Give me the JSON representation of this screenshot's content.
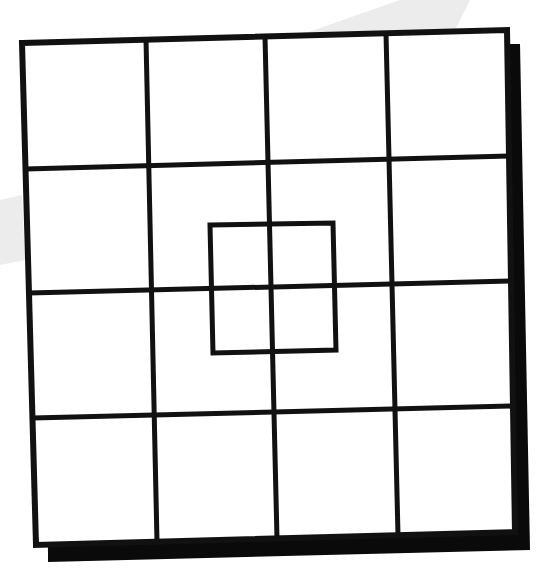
{
  "puzzle": {
    "kind": "square-grid-counting",
    "grid_rows": 4,
    "grid_cols": 4,
    "has_inner_square": true,
    "colors": {
      "background": "#ffffff",
      "line": "#111111",
      "shadow": "#0a0a0a",
      "watermark": "#ececec"
    },
    "outer": {
      "tl": [
        22,
        43
      ],
      "tr": [
        507,
        30
      ],
      "br": [
        515,
        532
      ],
      "bl": [
        36,
        545
      ]
    },
    "shadow": {
      "tl": [
        47,
        44
      ],
      "tr": [
        520,
        44
      ],
      "br": [
        530,
        550
      ],
      "bl": [
        48,
        562
      ]
    },
    "verticals_top_x": [
      146,
      265,
      386
    ],
    "verticals_bottom_x": [
      157,
      277,
      398
    ],
    "horizontals_left_y": [
      169,
      293,
      418
    ],
    "horizontals_right_y": [
      156,
      281,
      406
    ],
    "inner_square": {
      "tl": [
        210,
        225
      ],
      "tr": [
        333,
        223
      ],
      "br": [
        336,
        350
      ],
      "bl": [
        213,
        353
      ]
    },
    "line_width": 5
  }
}
